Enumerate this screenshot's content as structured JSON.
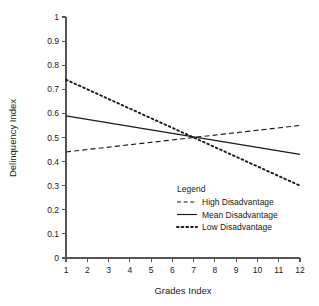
{
  "chart_data": {
    "type": "line",
    "title": "",
    "xlabel": "Grades Index",
    "ylabel": "Delinquency Index",
    "xlim": [
      1,
      12
    ],
    "ylim": [
      0,
      1
    ],
    "grid": false,
    "legend_position": "center-right-inside",
    "legend_title": "Legend",
    "x": [
      1,
      12
    ],
    "xticks": [
      "1",
      "2",
      "3",
      "4",
      "5",
      "6",
      "7",
      "8",
      "9",
      "10",
      "11",
      "12"
    ],
    "yticks": [
      "0",
      "0.1",
      "0.2",
      "0.3",
      "0.4",
      "0.5",
      "0.6",
      "0.7",
      "0.8",
      "0.9",
      "1"
    ],
    "series": [
      {
        "name": "High Disadvantage",
        "style": "dashed",
        "color": "#1a1a1a",
        "values": [
          0.44,
          0.55
        ]
      },
      {
        "name": "Mean Disadvantage",
        "style": "solid",
        "color": "#1a1a1a",
        "values": [
          0.59,
          0.43
        ]
      },
      {
        "name": "Low Disadvantage",
        "style": "dotted",
        "color": "#1a1a1a",
        "values": [
          0.74,
          0.3
        ]
      }
    ],
    "crossing_point": {
      "x": 7.3,
      "y": 0.5
    }
  },
  "axes": {
    "x_title": "Grades Index",
    "y_title": "Delinquency Index"
  },
  "legend": {
    "title": "Legend",
    "entries": [
      {
        "label": "High Disadvantage",
        "style": "dashed"
      },
      {
        "label": "Mean Disadvantage",
        "style": "solid"
      },
      {
        "label": "Low Disadvantage",
        "style": "dotted"
      }
    ]
  }
}
